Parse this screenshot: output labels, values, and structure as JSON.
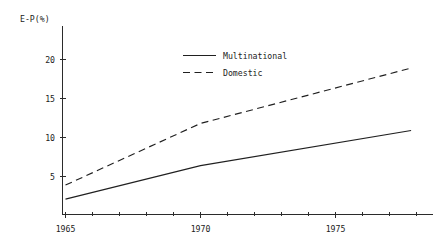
{
  "chart_data": {
    "type": "line",
    "title": "",
    "subtitle": "",
    "xlabel": "",
    "ylabel": "E-P(%)",
    "ylabel_display": "E-P(%)",
    "xlim": [
      1964.6,
      1978.0
    ],
    "ylim": [
      0,
      22.5
    ],
    "yticks": [
      5,
      10,
      15,
      20
    ],
    "ytick_labels": [
      "5",
      "10",
      "15",
      "20"
    ],
    "xticks": [
      1965,
      1970,
      1975
    ],
    "xtick_labels": [
      "1965",
      "1970",
      "1975"
    ],
    "x_minor_tick_interval": 1,
    "grid": false,
    "legend_position": "upper center",
    "x": [
      1965,
      1970,
      1977.8
    ],
    "series": [
      {
        "name": "Multinational",
        "style": "solid",
        "color": "#202020",
        "values": [
          2.1,
          6.4,
          10.9
        ]
      },
      {
        "name": "Domestic",
        "style": "dashed",
        "color": "#202020",
        "values": [
          3.9,
          11.8,
          18.9
        ]
      }
    ],
    "annotations": []
  },
  "legend": {
    "entries": [
      {
        "label": "Multinational",
        "style": "solid"
      },
      {
        "label": "Domestic",
        "style": "dashed"
      }
    ]
  },
  "axes": {
    "y_title": "E-P(%)",
    "y_tick_labels": [
      "20",
      "15",
      "10",
      "5"
    ],
    "x_tick_labels": [
      "1965",
      "1970",
      "1975"
    ]
  }
}
